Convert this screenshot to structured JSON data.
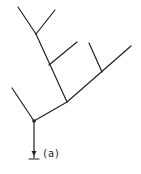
{
  "diagram": {
    "label": "(a)",
    "stroke_color": "#222222",
    "background": "#ffffff",
    "type": "branching-tree"
  }
}
